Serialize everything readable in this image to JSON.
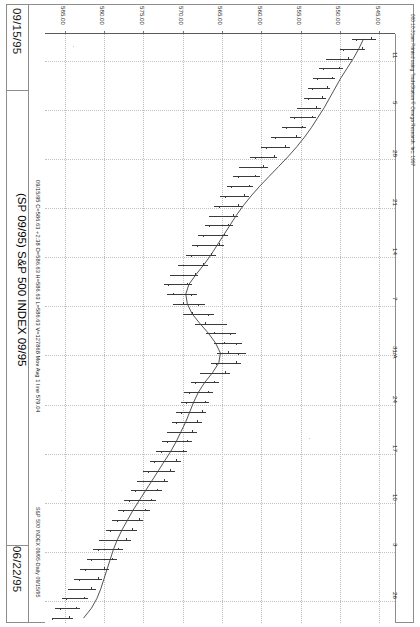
{
  "header": {
    "top_right_date": "09/15/95",
    "bottom_left_date": "06/22/95",
    "chart_title": "(SP 09/95) S&P 500 INDEX 09/95",
    "symbol_line": "S&P 500 INDEX 09/95-Daily  09/15/95",
    "quote_line": "09/15/95 C=586.63 +2.38 O=586.63 H=586.63 L=586.63 V=127868 Mov Avg 1 line  579.04",
    "copyright": "000 10.31am Printed using TradeStation © Omega Research, Inc. 1997"
  },
  "quote": {
    "date": "09/15/95",
    "close_label": "C=",
    "close": "586.63",
    "change": "+2.38",
    "open_label": "O=",
    "open": "586.63",
    "high_label": "H=",
    "high": "586.63",
    "low_label": "L=",
    "low": "586.63",
    "volume_label": "V=",
    "volume": "127868",
    "indicator": "Mov Avg 1 line",
    "indicator_value": "579.04"
  },
  "colors": {
    "bar": "#3a3a3a",
    "ma_line": "#404040",
    "grid": "#c2c2c2",
    "frame": "#8d8d8d",
    "text": "#1a1a1a",
    "background": "#ffffff"
  },
  "chart_data": {
    "type": "line",
    "chart_style": "ohlc-bar",
    "title": "(SP 09/95) S&P 500 INDEX 09/95",
    "subtitle": "S&P 500 INDEX 09/95-Daily  09/15/95",
    "xlabel": "",
    "ylabel": "",
    "orientation": "rotated-90",
    "grid": true,
    "legend_position": "none",
    "price_axis": {
      "labels": [
        "585.00",
        "580.00",
        "575.00",
        "570.00",
        "565.00",
        "560.00",
        "555.00",
        "550.00",
        "545.00"
      ],
      "values": [
        585.0,
        580.0,
        575.0,
        570.0,
        565.0,
        560.0,
        555.0,
        550.0,
        545.0
      ],
      "min": 543.0,
      "max": 587.5,
      "tick_step": 5.0
    },
    "date_axis": {
      "labels": [
        "11",
        "5",
        "28",
        "21",
        "14",
        "7",
        "31/A",
        "24",
        "17",
        "10",
        "3",
        "26"
      ],
      "start_date": "06/22/95",
      "end_date": "09/15/95"
    },
    "annotations": [
      {
        "name": "moving-average",
        "label": "Mov Avg 1 line",
        "value": 579.04
      }
    ],
    "series": [
      {
        "name": "S&P 500 INDEX 09/95 Daily OHLC",
        "bars": [
          {
            "i": 0,
            "h": 548.5,
            "l": 545.4,
            "o": 546.0,
            "c": 548.0
          },
          {
            "i": 1,
            "h": 550.0,
            "l": 546.8,
            "o": 547.2,
            "c": 549.6
          },
          {
            "i": 2,
            "h": 551.8,
            "l": 548.5,
            "o": 549.0,
            "c": 551.2
          },
          {
            "i": 3,
            "h": 552.6,
            "l": 549.6,
            "o": 550.1,
            "c": 552.2
          },
          {
            "i": 4,
            "h": 553.4,
            "l": 550.6,
            "o": 551.0,
            "c": 552.9
          },
          {
            "i": 5,
            "h": 554.0,
            "l": 551.2,
            "o": 551.6,
            "c": 553.6
          },
          {
            "i": 6,
            "h": 554.6,
            "l": 551.8,
            "o": 552.3,
            "c": 554.1
          },
          {
            "i": 7,
            "h": 555.4,
            "l": 552.4,
            "o": 553.0,
            "c": 554.8
          },
          {
            "i": 8,
            "h": 556.3,
            "l": 553.1,
            "o": 553.6,
            "c": 555.8
          },
          {
            "i": 9,
            "h": 557.4,
            "l": 554.3,
            "o": 554.8,
            "c": 556.9
          },
          {
            "i": 10,
            "h": 558.8,
            "l": 555.0,
            "o": 555.6,
            "c": 558.2
          },
          {
            "i": 11,
            "h": 560.0,
            "l": 556.4,
            "o": 557.0,
            "c": 559.4
          },
          {
            "i": 12,
            "h": 561.4,
            "l": 558.0,
            "o": 558.4,
            "c": 560.8
          },
          {
            "i": 13,
            "h": 562.8,
            "l": 559.2,
            "o": 559.8,
            "c": 562.0
          },
          {
            "i": 14,
            "h": 563.6,
            "l": 560.2,
            "o": 560.8,
            "c": 563.0
          },
          {
            "i": 15,
            "h": 564.4,
            "l": 561.0,
            "o": 561.6,
            "c": 563.8
          },
          {
            "i": 16,
            "h": 565.2,
            "l": 561.6,
            "o": 562.2,
            "c": 564.6
          },
          {
            "i": 17,
            "h": 566.0,
            "l": 562.3,
            "o": 562.9,
            "c": 565.4
          },
          {
            "i": 18,
            "h": 566.6,
            "l": 563.0,
            "o": 563.6,
            "c": 566.0
          },
          {
            "i": 19,
            "h": 567.2,
            "l": 563.6,
            "o": 564.2,
            "c": 566.6
          },
          {
            "i": 20,
            "h": 568.0,
            "l": 564.2,
            "o": 564.8,
            "c": 567.4
          },
          {
            "i": 21,
            "h": 568.8,
            "l": 564.8,
            "o": 565.4,
            "c": 568.2
          },
          {
            "i": 22,
            "h": 569.6,
            "l": 565.8,
            "o": 566.4,
            "c": 569.0
          },
          {
            "i": 23,
            "h": 570.6,
            "l": 566.8,
            "o": 567.4,
            "c": 570.0
          },
          {
            "i": 24,
            "h": 571.6,
            "l": 568.0,
            "o": 568.4,
            "c": 571.0
          },
          {
            "i": 25,
            "h": 572.4,
            "l": 568.8,
            "o": 569.4,
            "c": 571.8
          },
          {
            "i": 26,
            "h": 572.0,
            "l": 568.2,
            "o": 571.2,
            "c": 569.0
          },
          {
            "i": 27,
            "h": 571.2,
            "l": 567.2,
            "o": 570.0,
            "c": 568.0
          },
          {
            "i": 28,
            "h": 570.0,
            "l": 566.0,
            "o": 568.8,
            "c": 566.8
          },
          {
            "i": 29,
            "h": 568.4,
            "l": 564.4,
            "o": 567.2,
            "c": 565.2
          },
          {
            "i": 30,
            "h": 567.0,
            "l": 563.2,
            "o": 566.0,
            "c": 564.0
          },
          {
            "i": 31,
            "h": 566.0,
            "l": 562.4,
            "o": 564.8,
            "c": 563.2
          },
          {
            "i": 32,
            "h": 565.6,
            "l": 562.0,
            "o": 564.2,
            "c": 563.0
          },
          {
            "i": 33,
            "h": 566.4,
            "l": 562.6,
            "o": 563.2,
            "c": 565.8
          },
          {
            "i": 34,
            "h": 567.8,
            "l": 564.0,
            "o": 564.6,
            "c": 567.2
          },
          {
            "i": 35,
            "h": 569.0,
            "l": 565.4,
            "o": 566.0,
            "c": 568.4
          },
          {
            "i": 36,
            "h": 569.8,
            "l": 566.2,
            "o": 566.8,
            "c": 569.2
          },
          {
            "i": 37,
            "h": 570.2,
            "l": 566.6,
            "o": 567.2,
            "c": 569.6
          },
          {
            "i": 38,
            "h": 570.8,
            "l": 567.0,
            "o": 567.6,
            "c": 570.2
          },
          {
            "i": 39,
            "h": 571.4,
            "l": 567.6,
            "o": 568.2,
            "c": 570.8
          },
          {
            "i": 40,
            "h": 572.0,
            "l": 568.2,
            "o": 568.8,
            "c": 571.4
          },
          {
            "i": 41,
            "h": 572.6,
            "l": 568.8,
            "o": 569.4,
            "c": 572.0
          },
          {
            "i": 42,
            "h": 573.4,
            "l": 569.4,
            "o": 570.0,
            "c": 572.8
          },
          {
            "i": 43,
            "h": 574.2,
            "l": 570.2,
            "o": 570.8,
            "c": 573.6
          },
          {
            "i": 44,
            "h": 575.0,
            "l": 571.0,
            "o": 571.6,
            "c": 574.4
          },
          {
            "i": 45,
            "h": 575.8,
            "l": 571.8,
            "o": 572.4,
            "c": 575.2
          },
          {
            "i": 46,
            "h": 576.6,
            "l": 572.6,
            "o": 573.2,
            "c": 576.0
          },
          {
            "i": 47,
            "h": 577.4,
            "l": 573.4,
            "o": 574.0,
            "c": 576.8
          },
          {
            "i": 48,
            "h": 578.2,
            "l": 574.2,
            "o": 574.8,
            "c": 577.6
          },
          {
            "i": 49,
            "h": 579.0,
            "l": 575.0,
            "o": 575.6,
            "c": 578.4
          },
          {
            "i": 50,
            "h": 579.8,
            "l": 575.8,
            "o": 576.4,
            "c": 579.2
          },
          {
            "i": 51,
            "h": 580.6,
            "l": 576.6,
            "o": 577.2,
            "c": 580.0
          },
          {
            "i": 52,
            "h": 581.4,
            "l": 577.6,
            "o": 578.2,
            "c": 580.8
          },
          {
            "i": 53,
            "h": 582.2,
            "l": 578.4,
            "o": 579.0,
            "c": 581.6
          },
          {
            "i": 54,
            "h": 583.0,
            "l": 579.4,
            "o": 580.0,
            "c": 582.4
          },
          {
            "i": 55,
            "h": 583.8,
            "l": 580.2,
            "o": 580.8,
            "c": 583.2
          },
          {
            "i": 56,
            "h": 584.6,
            "l": 581.0,
            "o": 581.6,
            "c": 584.0
          },
          {
            "i": 57,
            "h": 585.4,
            "l": 582.0,
            "o": 582.6,
            "c": 584.8
          },
          {
            "i": 58,
            "h": 586.2,
            "l": 583.0,
            "o": 583.6,
            "c": 585.6
          },
          {
            "i": 59,
            "h": 586.63,
            "l": 584.0,
            "o": 584.4,
            "c": 586.63
          }
        ]
      },
      {
        "name": "Mov Avg 1 line",
        "type": "line",
        "last_value": 579.04,
        "values": [
          547.0,
          547.6,
          548.3,
          549.1,
          549.9,
          550.6,
          551.3,
          552.0,
          552.8,
          553.6,
          554.5,
          555.5,
          556.6,
          557.8,
          559.0,
          560.2,
          561.3,
          562.3,
          563.2,
          564.0,
          564.8,
          565.6,
          566.4,
          567.3,
          568.3,
          569.2,
          569.6,
          569.4,
          568.8,
          567.8,
          566.7,
          565.8,
          565.2,
          565.4,
          566.2,
          567.2,
          568.0,
          568.6,
          569.1,
          569.6,
          570.2,
          570.8,
          571.5,
          572.3,
          573.1,
          573.9,
          574.7,
          575.5,
          576.3,
          577.0,
          577.7,
          578.3,
          578.8,
          579.2,
          579.6,
          580.0,
          580.4,
          580.9,
          581.6,
          582.6
        ]
      }
    ]
  }
}
